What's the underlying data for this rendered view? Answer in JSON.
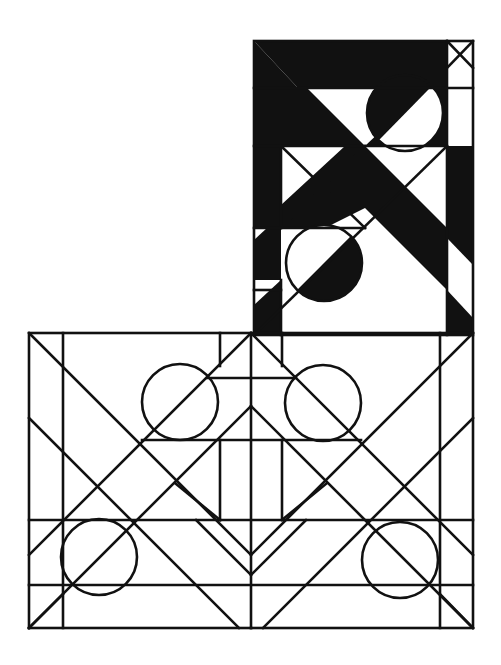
{
  "artwork": {
    "title": "Geometric composition",
    "width": 501,
    "height": 665,
    "colors": {
      "ink": "#111111",
      "paper": "#ffffff"
    },
    "upper_panel": {
      "description": "tall black-and-white panel with diagonal bands and two half-filled circles",
      "frame": {
        "x": 254,
        "y": 41,
        "w": 219,
        "h": 294
      },
      "filled_polygons": [
        [
          [
            254,
            41
          ],
          [
            447,
            41
          ],
          [
            447,
            88
          ],
          [
            298,
            88
          ]
        ],
        [
          [
            254,
            41
          ],
          [
            298,
            88
          ],
          [
            254,
            88
          ]
        ],
        [
          [
            254,
            88
          ],
          [
            307,
            88
          ],
          [
            365,
            146
          ],
          [
            254,
            146
          ]
        ],
        [
          [
            365,
            146
          ],
          [
            447,
            146
          ],
          [
            447,
            88
          ],
          [
            426,
            88
          ],
          [
            365,
            146
          ]
        ],
        [
          [
            254,
            146
          ],
          [
            281,
            146
          ],
          [
            281,
            228
          ],
          [
            254,
            228
          ]
        ],
        [
          [
            447,
            146
          ],
          [
            473,
            146
          ],
          [
            473,
            265
          ],
          [
            447,
            238
          ]
        ],
        [
          [
            365,
            146
          ],
          [
            405,
            186
          ],
          [
            447,
            228
          ],
          [
            447,
            290
          ],
          [
            365,
            208
          ],
          [
            325,
            228
          ],
          [
            281,
            228
          ],
          [
            281,
            205
          ],
          [
            345,
            146
          ]
        ],
        [
          [
            254,
            240
          ],
          [
            281,
            215
          ],
          [
            281,
            280
          ],
          [
            254,
            280
          ]
        ],
        [
          [
            254,
            305
          ],
          [
            281,
            280
          ],
          [
            281,
            335
          ],
          [
            254,
            335
          ]
        ],
        [
          [
            447,
            290
          ],
          [
            473,
            318
          ],
          [
            473,
            335
          ],
          [
            447,
            335
          ]
        ]
      ],
      "circles": [
        {
          "cx": 405,
          "cy": 113,
          "r": 38,
          "fill_half": "upper-left"
        },
        {
          "cx": 324,
          "cy": 263,
          "r": 38,
          "fill_half": "lower-right"
        }
      ]
    },
    "lower_panel": {
      "description": "line-drawn panel with crossing diagonals and four circles",
      "frame": {
        "x": 29,
        "y": 333,
        "w": 444,
        "h": 295
      },
      "circles": [
        {
          "cx": 180,
          "cy": 402,
          "r": 38
        },
        {
          "cx": 323,
          "cy": 403,
          "r": 38
        },
        {
          "cx": 99,
          "cy": 557,
          "r": 38
        },
        {
          "cx": 400,
          "cy": 560,
          "r": 38
        }
      ]
    }
  }
}
